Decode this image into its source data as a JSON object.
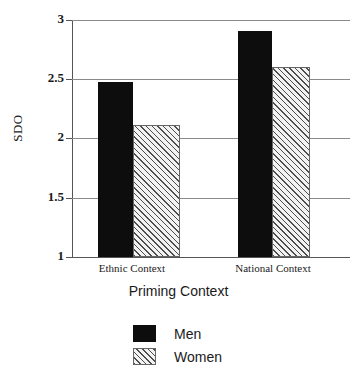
{
  "chart_data": {
    "type": "bar",
    "title": "",
    "xlabel": "Priming Context",
    "ylabel": "SDO",
    "categories": [
      "Ethnic Context",
      "National Context"
    ],
    "series": [
      {
        "name": "Men",
        "values": [
          2.48,
          2.91
        ],
        "color": "#0d0d0d",
        "fill": "solid-black"
      },
      {
        "name": "Women",
        "values": [
          2.11,
          2.6
        ],
        "color": "#f2f2f2",
        "fill": "diagonal-hatch"
      }
    ],
    "ylim": [
      1,
      3
    ],
    "yticks": [
      1,
      1.5,
      2,
      2.5,
      3
    ],
    "ytick_labels": [
      "1",
      "1.5",
      "2",
      "2.5",
      "3"
    ],
    "grid": true,
    "legend_position": "bottom-center"
  },
  "axis": {
    "y_title": "SDO",
    "x_title": "Priming Context",
    "ticks": [
      {
        "label": "3",
        "value": 3
      },
      {
        "label": "2.5",
        "value": 2.5
      },
      {
        "label": "2",
        "value": 2
      },
      {
        "label": "1.5",
        "value": 1.5
      },
      {
        "label": "1",
        "value": 1
      }
    ]
  },
  "categories": [
    {
      "label": "Ethnic Context"
    },
    {
      "label": "National Context"
    }
  ],
  "legend": {
    "entries": [
      {
        "label": "Men",
        "swatch": "solid-black-swatch"
      },
      {
        "label": "Women",
        "swatch": "hatched-swatch"
      }
    ]
  }
}
